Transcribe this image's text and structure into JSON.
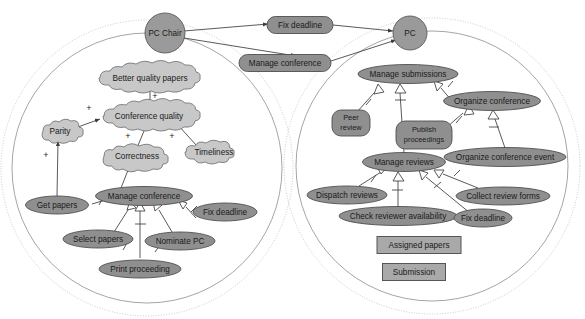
{
  "diagram": {
    "notation": "i* softgoal / UML use case hybrid",
    "colors": {
      "actor_fill": "#9a9a9a",
      "usecase_fill": "#8f8f8f",
      "softgoal_fill": "#c8c8c8",
      "entity_fill": "#a9a9a9",
      "boundary_stroke": "#8e8e8e",
      "edge_stroke": "#3c3c3c"
    },
    "actors": [
      {
        "id": "pc_chair",
        "label": "PC Chair",
        "cx": 165,
        "cy": 33,
        "r": 20
      },
      {
        "id": "pc",
        "label": "PC",
        "cx": 410,
        "cy": 33,
        "r": 17
      }
    ],
    "top_usecases": [
      {
        "id": "t_fix_deadline",
        "label": "Fix deadline",
        "cx": 300,
        "cy": 25,
        "w": 66,
        "h": 17
      },
      {
        "id": "t_manage_conf",
        "label": "Manage conference",
        "cx": 285,
        "cy": 63,
        "w": 92,
        "h": 17
      }
    ],
    "left_system": {
      "boundary_label": "",
      "softgoals": [
        {
          "id": "better_quality",
          "label": "Better quality papers",
          "cx": 150,
          "cy": 78,
          "w": 110,
          "h": 15
        },
        {
          "id": "conf_quality",
          "label": "Conference quality",
          "cx": 149,
          "cy": 116,
          "w": 100,
          "h": 15
        },
        {
          "id": "parity",
          "label": "Parity",
          "cx": 59,
          "cy": 131,
          "w": 38,
          "h": 15
        },
        {
          "id": "correctness",
          "label": "Correctness",
          "cx": 137,
          "cy": 156,
          "w": 70,
          "h": 15
        },
        {
          "id": "timeliness",
          "label": "Timeliness",
          "cx": 213,
          "cy": 152,
          "w": 60,
          "h": 15
        }
      ],
      "usecases": [
        {
          "id": "get_papers",
          "label": "Get papers",
          "cx": 57,
          "cy": 205,
          "w": 63,
          "h": 17
        },
        {
          "id": "manage_conference",
          "label": "Manage conference",
          "cx": 144,
          "cy": 196,
          "w": 97,
          "h": 18
        },
        {
          "id": "fix_deadline_l",
          "label": "Fix deadline",
          "cx": 225,
          "cy": 212,
          "w": 64,
          "h": 17
        },
        {
          "id": "select_papers",
          "label": "Select papers",
          "cx": 98,
          "cy": 239,
          "w": 70,
          "h": 17
        },
        {
          "id": "nominate_pc",
          "label": "Nominate PC",
          "cx": 180,
          "cy": 241,
          "w": 70,
          "h": 17
        },
        {
          "id": "print_proceeding",
          "label": "Print proceeding",
          "cx": 140,
          "cy": 269,
          "w": 82,
          "h": 17
        }
      ],
      "contributions": [
        {
          "from": "better_quality",
          "to": "conf_quality",
          "label": "+"
        },
        {
          "from": "parity",
          "to": "conf_quality",
          "label": "+"
        },
        {
          "from": "correctness",
          "to": "conf_quality",
          "label": "+"
        },
        {
          "from": "timeliness",
          "to": "conf_quality",
          "label": "+"
        },
        {
          "from": "get_papers",
          "to": "parity",
          "label": "+"
        }
      ]
    },
    "right_system": {
      "boundary_label": "",
      "usecases": [
        {
          "id": "manage_submissions",
          "label": "Manage submissions",
          "cx": 408,
          "cy": 74,
          "w": 100,
          "h": 18
        },
        {
          "id": "organize_conference",
          "label": "Organize conference",
          "cx": 492,
          "cy": 101,
          "w": 97,
          "h": 18
        },
        {
          "id": "peer_review",
          "label": "Peer review",
          "line1": "Peer",
          "line2": "review",
          "cx": 351,
          "cy": 123,
          "w": 38,
          "h": 26
        },
        {
          "id": "publish_proceedings",
          "label": "Publish proceedings",
          "line1": "Publish",
          "line2": "proceedings",
          "cx": 424,
          "cy": 135,
          "w": 56,
          "h": 28
        },
        {
          "id": "organize_conference_event",
          "label": "Organize conference event",
          "cx": 505,
          "cy": 157,
          "w": 122,
          "h": 18
        },
        {
          "id": "manage_reviews",
          "label": "Manage reviews",
          "cx": 404,
          "cy": 162,
          "w": 83,
          "h": 18
        },
        {
          "id": "dispatch_reviews",
          "label": "Dispatch reviews",
          "cx": 347,
          "cy": 195,
          "w": 80,
          "h": 17
        },
        {
          "id": "collect_review_forms",
          "label": "Collect review forms",
          "cx": 503,
          "cy": 196,
          "w": 94,
          "h": 17
        },
        {
          "id": "check_reviewer_availability",
          "label": "Check reviewer availability",
          "cx": 398,
          "cy": 216,
          "w": 118,
          "h": 17
        },
        {
          "id": "fix_deadline_r",
          "label": "Fix deadline",
          "cx": 483,
          "cy": 218,
          "w": 58,
          "h": 17
        }
      ],
      "entities": [
        {
          "id": "assigned_papers",
          "label": "Assigned papers",
          "cx": 419,
          "cy": 245,
          "w": 84,
          "h": 17
        },
        {
          "id": "submission",
          "label": "Submission",
          "cx": 414,
          "cy": 272,
          "w": 63,
          "h": 17
        }
      ]
    }
  }
}
